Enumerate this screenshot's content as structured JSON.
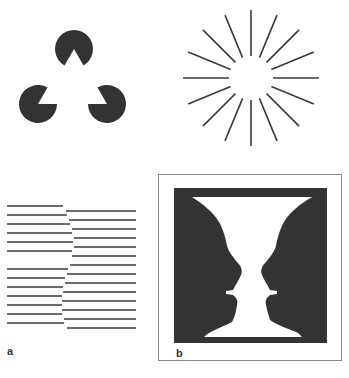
{
  "figure": {
    "colors": {
      "background": "#ffffff",
      "ink": "#333333",
      "line": "#3a3a3a",
      "frame": "#8a8a8a"
    },
    "kanizsa": {
      "radius": 19,
      "pacmen": [
        {
          "name": "top",
          "cx": 74,
          "cy": 49,
          "mouth_direction_deg": 90
        },
        {
          "name": "bottom-left",
          "cx": 38,
          "cy": 104,
          "mouth_direction_deg": -30
        },
        {
          "name": "bottom-right",
          "cx": 107,
          "cy": 104,
          "mouth_direction_deg": 210
        }
      ],
      "mouth_angle_deg": 60
    },
    "sunburst": {
      "cx": 251,
      "cy": 78,
      "inner_radius": 22,
      "outer_radius": 68,
      "ray_count": 16
    },
    "lines_panel": {
      "label": "a",
      "left_lines": [
        {
          "y": 206,
          "x1": 7,
          "x2": 63
        },
        {
          "y": 215,
          "x1": 7,
          "x2": 67
        },
        {
          "y": 224,
          "x1": 7,
          "x2": 70
        },
        {
          "y": 233,
          "x1": 7,
          "x2": 72
        },
        {
          "y": 242,
          "x1": 7,
          "x2": 73
        },
        {
          "y": 251,
          "x1": 7,
          "x2": 72
        },
        {
          "y": 269,
          "x1": 7,
          "x2": 68
        },
        {
          "y": 278,
          "x1": 7,
          "x2": 65
        },
        {
          "y": 287,
          "x1": 7,
          "x2": 63
        },
        {
          "y": 296,
          "x1": 7,
          "x2": 62
        },
        {
          "y": 305,
          "x1": 7,
          "x2": 62
        },
        {
          "y": 314,
          "x1": 7,
          "x2": 62
        },
        {
          "y": 323,
          "x1": 7,
          "x2": 64
        }
      ],
      "right_lines": [
        {
          "y": 211,
          "x1": 66,
          "x2": 136
        },
        {
          "y": 220,
          "x1": 69,
          "x2": 136
        },
        {
          "y": 229,
          "x1": 72,
          "x2": 136
        },
        {
          "y": 238,
          "x1": 74,
          "x2": 136
        },
        {
          "y": 247,
          "x1": 74,
          "x2": 136
        },
        {
          "y": 256,
          "x1": 72,
          "x2": 136
        },
        {
          "y": 265,
          "x1": 70,
          "x2": 136
        },
        {
          "y": 274,
          "x1": 67,
          "x2": 136
        },
        {
          "y": 283,
          "x1": 65,
          "x2": 136
        },
        {
          "y": 292,
          "x1": 63,
          "x2": 136
        },
        {
          "y": 301,
          "x1": 62,
          "x2": 136
        },
        {
          "y": 310,
          "x1": 62,
          "x2": 136
        },
        {
          "y": 319,
          "x1": 64,
          "x2": 136
        },
        {
          "y": 328,
          "x1": 67,
          "x2": 136
        }
      ]
    },
    "vase_panel": {
      "label": "b"
    }
  }
}
